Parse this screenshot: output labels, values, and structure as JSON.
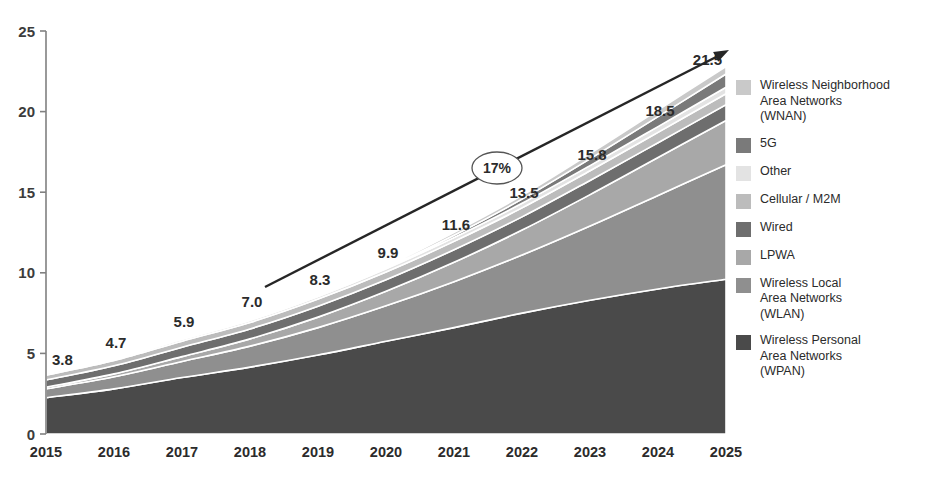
{
  "chart_data": {
    "type": "area",
    "title": "",
    "subtitle": "",
    "xlabel": "",
    "ylabel": "",
    "categories": [
      "2015",
      "2016",
      "2017",
      "2018",
      "2019",
      "2020",
      "2021",
      "2022",
      "2023",
      "2024",
      "2025"
    ],
    "totals": [
      3.8,
      4.7,
      5.9,
      7.0,
      8.3,
      9.9,
      11.6,
      13.5,
      15.8,
      18.5,
      21.5
    ],
    "total_labels": [
      "3.8",
      "4.7",
      "5.9",
      "7.0",
      "8.3",
      "9.9",
      "11.6",
      "13.5",
      "15.8",
      "18.5",
      "21.5"
    ],
    "stacked": true,
    "grid": false,
    "legend_position": "right",
    "ylim": [
      0,
      25
    ],
    "yticks": [
      0,
      5,
      10,
      15,
      20,
      25
    ],
    "ytick_labels": [
      "0",
      "5",
      "10",
      "15",
      "20",
      "25"
    ],
    "series": [
      {
        "name": "Wireless Personal Area Networks (WPAN)",
        "color": "#4a4a4a",
        "values": [
          2.25,
          2.8,
          3.5,
          4.15,
          4.9,
          5.75,
          6.6,
          7.5,
          8.3,
          9.0,
          9.6
        ]
      },
      {
        "name": "Wireless Local Area Networks (WLAN)",
        "color": "#8f8f8f",
        "values": [
          0.55,
          0.75,
          1.0,
          1.3,
          1.7,
          2.2,
          2.85,
          3.6,
          4.6,
          5.8,
          7.1
        ]
      },
      {
        "name": "LPWA",
        "color": "#a8a8a8",
        "values": [
          0.1,
          0.18,
          0.3,
          0.45,
          0.65,
          0.9,
          1.2,
          1.55,
          1.95,
          2.35,
          2.75
        ]
      },
      {
        "name": "Wired",
        "color": "#6e6e6e",
        "values": [
          0.45,
          0.5,
          0.58,
          0.62,
          0.68,
          0.72,
          0.78,
          0.82,
          0.88,
          0.92,
          0.98
        ]
      },
      {
        "name": "Cellular / M2M",
        "color": "#bcbcbc",
        "values": [
          0.3,
          0.33,
          0.38,
          0.4,
          0.44,
          0.48,
          0.52,
          0.56,
          0.6,
          0.64,
          0.68
        ]
      },
      {
        "name": "Other",
        "color": "#e3e3e3",
        "values": [
          0.08,
          0.1,
          0.12,
          0.14,
          0.16,
          0.2,
          0.24,
          0.28,
          0.32,
          0.36,
          0.4
        ]
      },
      {
        "name": "5G",
        "color": "#7a7a7a",
        "values": [
          0.0,
          0.0,
          0.0,
          0.0,
          0.02,
          0.06,
          0.14,
          0.26,
          0.42,
          0.62,
          0.82
        ]
      },
      {
        "name": "Wireless Neighborhood Area Networks (WNAN)",
        "color": "#c9c9c9",
        "values": [
          0.07,
          0.04,
          0.02,
          0.04,
          0.05,
          0.09,
          0.17,
          0.23,
          0.33,
          0.41,
          0.47
        ]
      }
    ],
    "annotations": [
      {
        "name": "cagr-arrow",
        "label": "17%",
        "type": "arrow-with-ellipse-label",
        "from_year": "2018",
        "to_year": "2025"
      }
    ]
  },
  "legend": {
    "items": [
      {
        "label": "Wireless Neighborhood\nArea Networks\n(WNAN)",
        "color": "#c9c9c9",
        "icon": "legend-swatch"
      },
      {
        "label": "5G",
        "color": "#7a7a7a",
        "icon": "legend-swatch"
      },
      {
        "label": "Other",
        "color": "#e3e3e3",
        "icon": "legend-swatch"
      },
      {
        "label": "Cellular / M2M",
        "color": "#bcbcbc",
        "icon": "legend-swatch"
      },
      {
        "label": "Wired",
        "color": "#6e6e6e",
        "icon": "legend-swatch"
      },
      {
        "label": "LPWA",
        "color": "#a8a8a8",
        "icon": "legend-swatch"
      },
      {
        "label": "Wireless Local\nArea Networks\n(WLAN)",
        "color": "#8f8f8f",
        "icon": "legend-swatch"
      },
      {
        "label": "Wireless Personal\nArea Networks\n(WPAN)",
        "color": "#4a4a4a",
        "icon": "legend-swatch"
      }
    ]
  },
  "axis_colors": {
    "axis_line": "#808080",
    "text": "#2b2b2b",
    "arrow": "#262626"
  }
}
